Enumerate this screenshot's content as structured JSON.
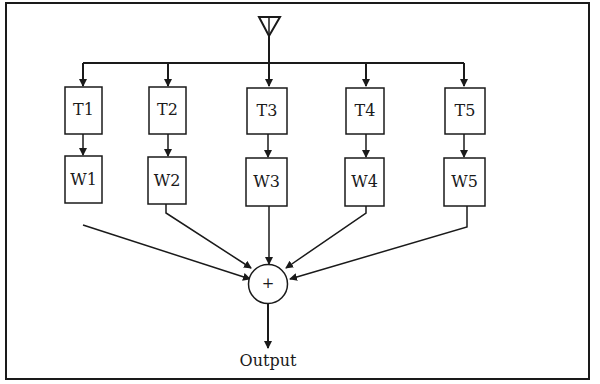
{
  "diagram": {
    "type": "beamforming block diagram",
    "input_symbol": "antenna",
    "taps": [
      {
        "t_label": "T1",
        "w_label": "W1"
      },
      {
        "t_label": "T2",
        "w_label": "W2"
      },
      {
        "t_label": "T3",
        "w_label": "W3"
      },
      {
        "t_label": "T4",
        "w_label": "W4"
      },
      {
        "t_label": "T5",
        "w_label": "W5"
      }
    ],
    "summer_symbol": "+",
    "output_label": "Output"
  },
  "colors": {
    "ink": "#1a1a1a",
    "background": "#ffffff"
  }
}
